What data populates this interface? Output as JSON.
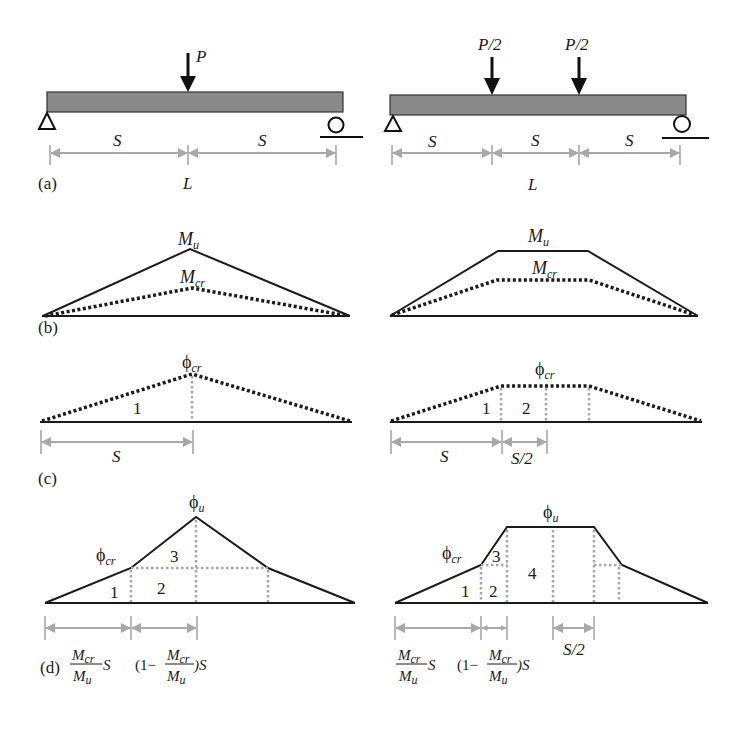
{
  "figure": {
    "panels": {
      "a": {
        "label": "(a)",
        "left": {
          "load": "P",
          "spans": [
            "S",
            "S"
          ],
          "length": "L"
        },
        "right": {
          "loads": [
            "P/2",
            "P/2"
          ],
          "spans": [
            "S",
            "S",
            "S"
          ],
          "length": "L"
        }
      },
      "b": {
        "label": "(b)",
        "left": {
          "moment_ultimate": "M",
          "moment_ultimate_sub": "u",
          "moment_cracking": "M",
          "moment_cracking_sub": "cr"
        },
        "right": {
          "moment_ultimate": "M",
          "moment_ultimate_sub": "u",
          "moment_cracking": "M",
          "moment_cracking_sub": "cr"
        }
      },
      "c": {
        "label": "(c)",
        "left": {
          "curvature": "ϕ",
          "curvature_sub": "cr",
          "region_labels": [
            "1"
          ],
          "dims": [
            "S"
          ]
        },
        "right": {
          "curvature": "ϕ",
          "curvature_sub": "cr",
          "region_labels": [
            "1",
            "2"
          ],
          "dims": [
            "S",
            "S/2"
          ]
        }
      },
      "d": {
        "label": "(d)",
        "left": {
          "curvature_ultimate": "ϕ",
          "curvature_ultimate_sub": "u",
          "curvature_cracking": "ϕ",
          "curvature_cracking_sub": "cr",
          "region_labels": [
            "1",
            "2",
            "3"
          ],
          "dims": {
            "first": {
              "num": "M",
              "num_sub": "cr",
              "den": "M",
              "den_sub": "u",
              "suffix": "S"
            },
            "second": {
              "prefix": "(1−",
              "num": "M",
              "num_sub": "cr",
              "den": "M",
              "den_sub": "u",
              "suffix": ")S"
            }
          }
        },
        "right": {
          "curvature_ultimate": "ϕ",
          "curvature_ultimate_sub": "u",
          "curvature_cracking": "ϕ",
          "curvature_cracking_sub": "cr",
          "region_labels": [
            "1",
            "2",
            "3",
            "4"
          ],
          "dims": {
            "first": {
              "num": "M",
              "num_sub": "cr",
              "den": "M",
              "den_sub": "u",
              "suffix": "S"
            },
            "second": {
              "prefix": "(1−",
              "num": "M",
              "num_sub": "cr",
              "den": "M",
              "den_sub": "u",
              "suffix": ")S"
            },
            "third": "S/2"
          }
        }
      }
    },
    "colors": {
      "ink": "#1a1a1a",
      "beam_fill": "#8a8a8a",
      "dimension_gray": "#a8a8a8",
      "dotted_gray": "#a6a6a6"
    }
  }
}
